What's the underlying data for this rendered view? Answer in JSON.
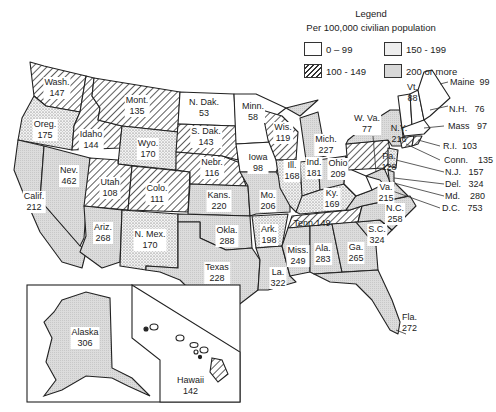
{
  "legend": {
    "title": "Legend",
    "subtitle": "Per 100,000 civilian population",
    "items": [
      {
        "label": "0 – 99",
        "pattern": "blank"
      },
      {
        "label": "150 - 199",
        "pattern": "dots"
      },
      {
        "label": "100 - 149",
        "pattern": "hatch"
      },
      {
        "label": "200 or more",
        "pattern": "shaded"
      }
    ]
  },
  "states": [
    {
      "name": "Wash.",
      "value": "147"
    },
    {
      "name": "Oreg.",
      "value": "175"
    },
    {
      "name": "Calif.",
      "value": "212"
    },
    {
      "name": "Nev.",
      "value": "462"
    },
    {
      "name": "Idaho",
      "value": "144"
    },
    {
      "name": "Mont.",
      "value": "135"
    },
    {
      "name": "Wyo.",
      "value": "170"
    },
    {
      "name": "Utah",
      "value": "108"
    },
    {
      "name": "Colo.",
      "value": "111"
    },
    {
      "name": "Ariz.",
      "value": "268"
    },
    {
      "name": "N. Mex.",
      "value": "170"
    },
    {
      "name": "N. Dak.",
      "value": "53"
    },
    {
      "name": "S. Dak.",
      "value": "143"
    },
    {
      "name": "Nebr.",
      "value": "116"
    },
    {
      "name": "Kans.",
      "value": "220"
    },
    {
      "name": "Okla.",
      "value": "288"
    },
    {
      "name": "Texas",
      "value": "228"
    },
    {
      "name": "Minn.",
      "value": "58"
    },
    {
      "name": "Iowa",
      "value": "98"
    },
    {
      "name": "Mo.",
      "value": "206"
    },
    {
      "name": "Ark.",
      "value": "198"
    },
    {
      "name": "La.",
      "value": "322"
    },
    {
      "name": "Wis.",
      "value": "119"
    },
    {
      "name": "Ill.",
      "value": "168"
    },
    {
      "name": "Mich.",
      "value": "227"
    },
    {
      "name": "Ind.",
      "value": "181"
    },
    {
      "name": "Ohio",
      "value": "209"
    },
    {
      "name": "Ky.",
      "value": "169"
    },
    {
      "name": "Tenn",
      "value": "149"
    },
    {
      "name": "Miss.",
      "value": "249"
    },
    {
      "name": "Ala.",
      "value": "283"
    },
    {
      "name": "Ga.",
      "value": "265"
    },
    {
      "name": "Fla.",
      "value": "272"
    },
    {
      "name": "S.C.",
      "value": "324"
    },
    {
      "name": "N.C.",
      "value": "258"
    },
    {
      "name": "Va.",
      "value": "215"
    },
    {
      "name": "W. Va.",
      "value": "77"
    },
    {
      "name": "Pa.",
      "value": "128"
    },
    {
      "name": "N.Y.",
      "value": "216"
    },
    {
      "name": "Vt.",
      "value": "88"
    },
    {
      "name": "Maine",
      "value": "99"
    },
    {
      "name": "N.H.",
      "value": "76"
    },
    {
      "name": "Mass",
      "value": "97"
    },
    {
      "name": "R.I.",
      "value": "103"
    },
    {
      "name": "Conn.",
      "value": "135"
    },
    {
      "name": "N.J.",
      "value": "157"
    },
    {
      "name": "Del.",
      "value": "324"
    },
    {
      "name": "Md.",
      "value": "280"
    },
    {
      "name": "D.C.",
      "value": "753"
    },
    {
      "name": "Alaska",
      "value": "306"
    },
    {
      "name": "Hawaii",
      "value": "142"
    }
  ]
}
